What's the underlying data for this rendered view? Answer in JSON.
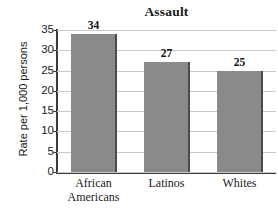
{
  "chart_data": {
    "type": "bar",
    "title": "Assault",
    "xlabel": "",
    "ylabel": "Rate per 1,000 persons",
    "categories": [
      "African Americans",
      "Latinos",
      "Whites"
    ],
    "category_lines": [
      [
        "African",
        "Americans"
      ],
      [
        "Latinos"
      ],
      [
        "Whites"
      ]
    ],
    "values": [
      34,
      27,
      25
    ],
    "value_labels": [
      "34",
      "27",
      "25"
    ],
    "ylim": [
      0,
      35
    ],
    "yticks": [
      35,
      30,
      25,
      20,
      15,
      10,
      5,
      0
    ],
    "ytick_labels": [
      "35",
      "30",
      "25",
      "20",
      "15",
      "10",
      "5",
      "0"
    ],
    "grid": "horizontal",
    "legend": "none",
    "colors": {
      "bar_fill": "#8a8a8a",
      "bar_edge": "#4a4a4a",
      "gridline": "#c9c9c9",
      "axis": "#3a3a3a",
      "text": "#1a1a1a",
      "background": "#ffffff"
    }
  }
}
